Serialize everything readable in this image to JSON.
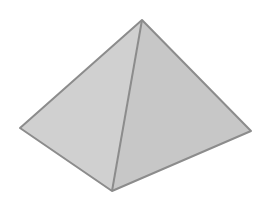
{
  "figure": {
    "vertices": {
      "apex": [
        142,
        20
      ],
      "left": [
        20,
        128
      ],
      "bottom": [
        112,
        191
      ],
      "right": [
        251,
        131
      ]
    },
    "colors": {
      "background": "#ffffff",
      "left_face": "#d0d0d0",
      "right_face": "#c7c7c7",
      "edge": "#8c8c8c"
    }
  }
}
